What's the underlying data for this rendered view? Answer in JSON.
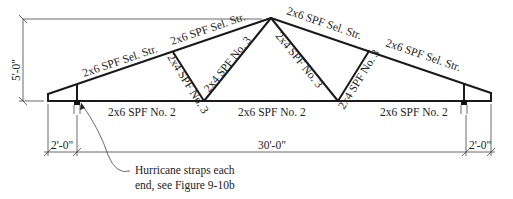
{
  "diagram": {
    "type": "roof-truss-elevation",
    "top_chord": {
      "left_lower": "2x6 SPF Sel. Str.",
      "left_upper": "2x6 SPF Sel. Str.",
      "right_upper": "2x6 SPF Sel. Str.",
      "right_lower": "2x6 SPF Sel. Str."
    },
    "webs": {
      "left_outer": "2x4 SPF No. 3",
      "left_inner": "2x4 SPF No. 3",
      "right_inner": "2x4 SPF No. 3",
      "right_outer": "2x4 SPF No. 3"
    },
    "bottom_chord": {
      "left": "2x6 SPF No. 2",
      "center": "2x6 SPF No. 2",
      "right": "2x6 SPF No. 2"
    },
    "dimensions": {
      "height": "5'-0\"",
      "left_overhang": "2'-0\"",
      "span": "30'-0\"",
      "right_overhang": "2'-0\""
    },
    "note": {
      "line1": "Hurricane straps each",
      "line2": "end, see Figure 9-10b"
    }
  }
}
